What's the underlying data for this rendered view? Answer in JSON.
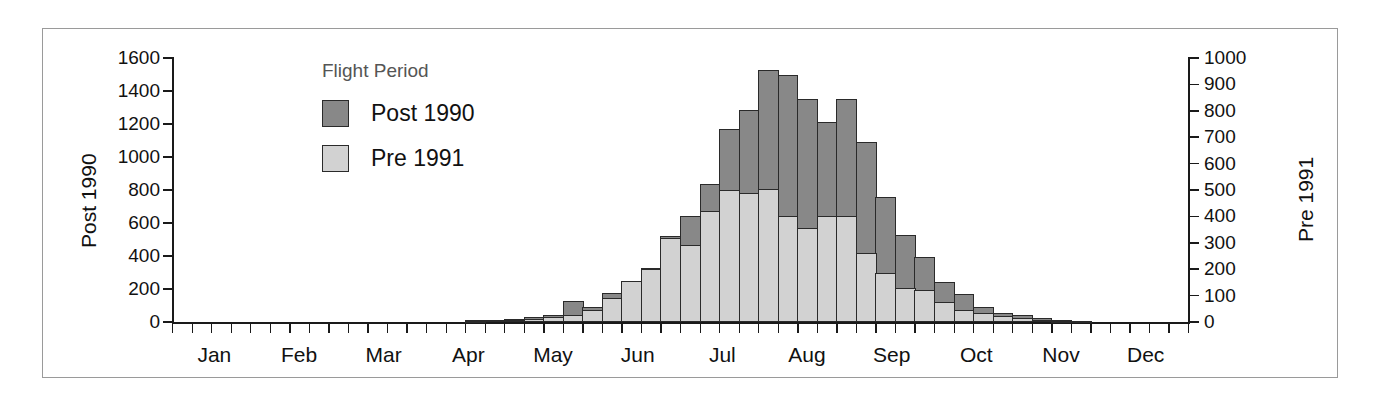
{
  "legend": {
    "title": "Flight Period",
    "entries": [
      {
        "label": "Post 1990",
        "color": "#888888"
      },
      {
        "label": "Pre 1991",
        "color": "#d2d2d2"
      }
    ]
  },
  "axes": {
    "left_title": "Post 1990",
    "right_title": "Pre 1991",
    "left_ticks": [
      "0",
      "200",
      "400",
      "600",
      "800",
      "1000",
      "1200",
      "1400",
      "1600"
    ],
    "right_ticks": [
      "0",
      "100",
      "200",
      "300",
      "400",
      "500",
      "600",
      "700",
      "800",
      "900",
      "1000"
    ]
  },
  "months": [
    "Jan",
    "Feb",
    "Mar",
    "Apr",
    "May",
    "Jun",
    "Jul",
    "Aug",
    "Sep",
    "Oct",
    "Nov",
    "Dec"
  ],
  "chart_data": {
    "type": "bar",
    "title": "",
    "xlabel": "",
    "ylabel": "Post 1990",
    "y2label": "Pre 1991",
    "ylim": [
      0,
      1600
    ],
    "y2lim": [
      0,
      1000
    ],
    "grid": false,
    "legend_position": "upper-left-inside",
    "bar_style": "overlapping",
    "x_tick_labels": [
      "Jan",
      "Feb",
      "Mar",
      "Apr",
      "May",
      "Jun",
      "Jul",
      "Aug",
      "Sep",
      "Oct",
      "Nov",
      "Dec"
    ],
    "x_bins": "52 weekly bins across the calendar year",
    "categories": [
      "W1",
      "W2",
      "W3",
      "W4",
      "W5",
      "W6",
      "W7",
      "W8",
      "W9",
      "W10",
      "W11",
      "W12",
      "W13",
      "W14",
      "W15",
      "W16",
      "W17",
      "W18",
      "W19",
      "W20",
      "W21",
      "W22",
      "W23",
      "W24",
      "W25",
      "W26",
      "W27",
      "W28",
      "W29",
      "W30",
      "W31",
      "W32",
      "W33",
      "W34",
      "W35",
      "W36",
      "W37",
      "W38",
      "W39",
      "W40",
      "W41",
      "W42",
      "W43",
      "W44",
      "W45",
      "W46",
      "W47",
      "W48",
      "W49",
      "W50",
      "W51",
      "W52"
    ],
    "series": [
      {
        "name": "Post 1990",
        "axis": "left",
        "color": "#888888",
        "values": [
          0,
          0,
          0,
          0,
          0,
          0,
          0,
          0,
          0,
          0,
          0,
          0,
          0,
          0,
          0,
          10,
          15,
          20,
          30,
          45,
          125,
          90,
          175,
          240,
          325,
          520,
          645,
          835,
          1170,
          1285,
          1530,
          1500,
          1350,
          1210,
          1350,
          1090,
          760,
          525,
          395,
          245,
          170,
          90,
          55,
          40,
          25,
          12,
          8,
          0,
          0,
          0,
          0,
          0
        ]
      },
      {
        "name": "Pre 1991",
        "axis": "right",
        "color": "#d2d2d2",
        "values": [
          0,
          0,
          0,
          0,
          0,
          0,
          0,
          0,
          0,
          0,
          0,
          0,
          0,
          0,
          0,
          4,
          6,
          8,
          12,
          18,
          28,
          45,
          90,
          155,
          200,
          320,
          290,
          420,
          500,
          490,
          505,
          400,
          355,
          400,
          400,
          260,
          185,
          130,
          120,
          75,
          45,
          35,
          22,
          14,
          8,
          5,
          3,
          0,
          0,
          0,
          0,
          0
        ]
      }
    ]
  }
}
